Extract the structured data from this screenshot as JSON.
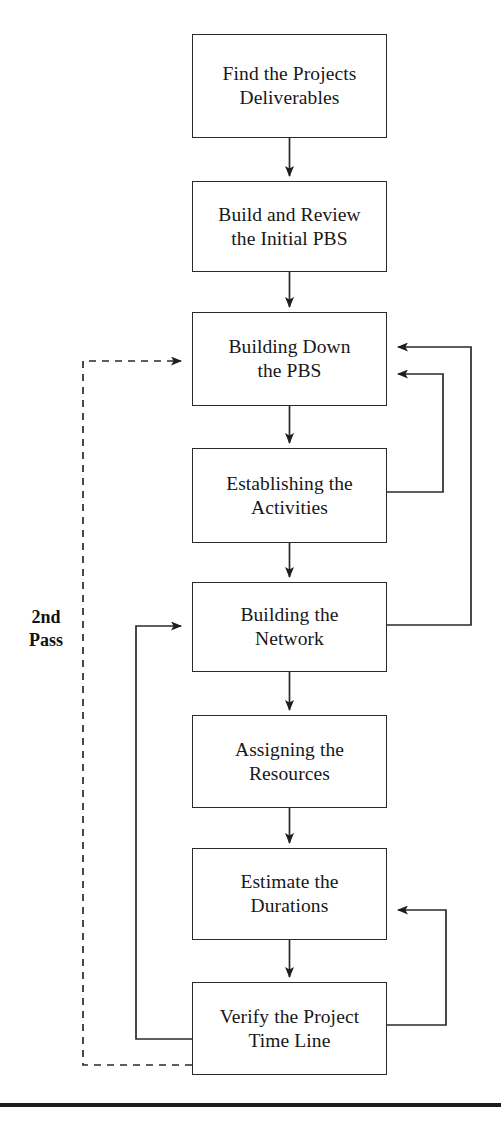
{
  "figure": {
    "background_color": "#ffffff",
    "line_color": "#2a2a2a"
  },
  "nodes": [
    {
      "id": "find-deliverables",
      "label": "Find the Projects\nDeliverables",
      "line1": "Find the Projects",
      "line2": "Deliverables"
    },
    {
      "id": "build-review-pbs",
      "label": "Build and Review\nthe Initial PBS",
      "line1": "Build and Review",
      "line2": "the Initial PBS"
    },
    {
      "id": "building-down-pbs",
      "label": "Building Down\nthe PBS",
      "line1": "Building Down",
      "line2": "the PBS"
    },
    {
      "id": "establish-activities",
      "label": "Establishing the\nActivities",
      "line1": "Establishing the",
      "line2": "Activities"
    },
    {
      "id": "build-network",
      "label": "Building the\nNetwork",
      "line1": "Building the",
      "line2": "Network"
    },
    {
      "id": "assign-resources",
      "label": "Assigning the\nResources",
      "line1": "Assigning the",
      "line2": "Resources"
    },
    {
      "id": "estimate-durations",
      "label": "Estimate the\nDurations",
      "line1": "Estimate the",
      "line2": "Durations"
    },
    {
      "id": "verify-time-line",
      "label": "Verify the Project\nTime Line",
      "line1": "Verify the Project",
      "line2": "Time Line"
    }
  ],
  "annotations": {
    "second_pass": "2nd\nPass"
  },
  "edges": [
    {
      "id": "e1",
      "from": "find-deliverables",
      "to": "build-review-pbs",
      "style": "solid",
      "arrow": true
    },
    {
      "id": "e2",
      "from": "build-review-pbs",
      "to": "building-down-pbs",
      "style": "solid",
      "arrow": true
    },
    {
      "id": "e3",
      "from": "building-down-pbs",
      "to": "establish-activities",
      "style": "solid",
      "arrow": true
    },
    {
      "id": "e4",
      "from": "establish-activities",
      "to": "build-network",
      "style": "solid",
      "arrow": true
    },
    {
      "id": "e5",
      "from": "build-network",
      "to": "assign-resources",
      "style": "solid",
      "arrow": true
    },
    {
      "id": "e6",
      "from": "assign-resources",
      "to": "estimate-durations",
      "style": "solid",
      "arrow": true
    },
    {
      "id": "e7",
      "from": "estimate-durations",
      "to": "verify-time-line",
      "style": "solid",
      "arrow": true
    },
    {
      "id": "e8",
      "from": "establish-activities",
      "to": "building-down-pbs",
      "style": "solid",
      "arrow": true,
      "route": "right-inner"
    },
    {
      "id": "e9",
      "from": "build-network",
      "to": "building-down-pbs",
      "style": "solid",
      "arrow": true,
      "route": "right-outer"
    },
    {
      "id": "e10",
      "from": "verify-time-line",
      "to": "estimate-durations",
      "style": "solid",
      "arrow": true,
      "route": "right-lower"
    },
    {
      "id": "e11",
      "from": "verify-time-line",
      "to": "build-network",
      "style": "solid",
      "arrow": true,
      "route": "left-inner"
    },
    {
      "id": "e12",
      "from": "verify-time-line",
      "to": "building-down-pbs",
      "style": "dashed",
      "arrow": true,
      "route": "left-outer",
      "label": "2nd Pass"
    }
  ]
}
